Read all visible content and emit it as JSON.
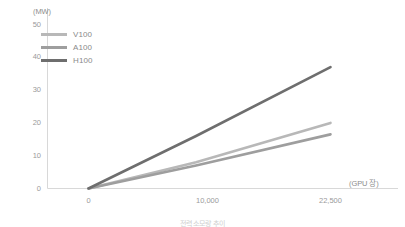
{
  "chart_data": {
    "type": "line",
    "title": "",
    "subtitle": "",
    "xlabel": "(GPU 장)",
    "ylabel": "(MW)",
    "xlim": [
      0,
      25500
    ],
    "ylim": [
      0,
      50
    ],
    "grid": false,
    "legend_position": "top-left",
    "x_ticks": [
      {
        "value": 0,
        "label": "0"
      },
      {
        "value": 10000,
        "label": "10,000"
      },
      {
        "value": 22500,
        "label": "22,500"
      }
    ],
    "y_ticks": [
      {
        "value": 0,
        "label": "0"
      },
      {
        "value": 10,
        "label": "10"
      },
      {
        "value": 20,
        "label": "20"
      },
      {
        "value": 30,
        "label": "30"
      },
      {
        "value": 40,
        "label": "40"
      },
      {
        "value": 50,
        "label": "50"
      }
    ],
    "series": [
      {
        "name": "V100",
        "color": "#b8b8b8",
        "x": [
          0,
          10000,
          22500
        ],
        "values": [
          0,
          8.0,
          20.0
        ]
      },
      {
        "name": "A100",
        "color": "#9e9e9e",
        "x": [
          0,
          10000,
          22500
        ],
        "values": [
          0,
          7.0,
          16.5
        ]
      },
      {
        "name": "H100",
        "color": "#6e6e6e",
        "x": [
          0,
          10000,
          22500
        ],
        "values": [
          0,
          16.0,
          37.0
        ]
      }
    ]
  },
  "legend": {
    "items": [
      {
        "label": "V100",
        "color": "#b8b8b8"
      },
      {
        "label": "A100",
        "color": "#9e9e9e"
      },
      {
        "label": "H100",
        "color": "#6e6e6e"
      }
    ]
  },
  "axes": {
    "y_unit": "(MW)",
    "x_unit": "(GPU 장)",
    "axis_color": "#d4d4d4"
  },
  "caption": {
    "text": "전력 소모량 추이"
  }
}
